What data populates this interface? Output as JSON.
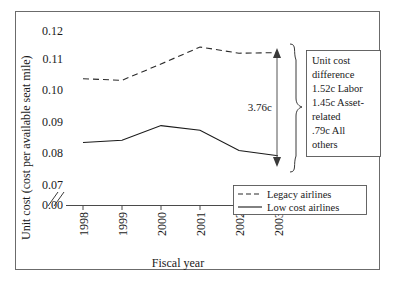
{
  "chart_data": {
    "type": "line",
    "title": "",
    "xlabel": "Fiscal year",
    "ylabel": "Unit cost (cost per available seat mile)",
    "categories": [
      "1998",
      "1999",
      "2000",
      "2001",
      "2002",
      "2003"
    ],
    "xtick_labels": [
      "1998",
      "1999",
      "2000",
      "2001",
      "2002",
      "2003"
    ],
    "ytick_labels": [
      "0.12",
      "0.11",
      "0.10",
      "0.09",
      "0.08",
      "0.07",
      "0.00"
    ],
    "ylim": [
      0.07,
      0.125
    ],
    "y_axis_break": true,
    "y_axis_break_label": "0.00",
    "grid": false,
    "legend_position": "bottom-right",
    "series": [
      {
        "name": "Legacy airlines",
        "style": "dashed",
        "values": [
          0.1045,
          0.104,
          0.1093,
          0.1148,
          0.1128,
          0.113
        ]
      },
      {
        "name": "Low cost airlines",
        "style": "solid",
        "values": [
          0.0838,
          0.0845,
          0.0893,
          0.0878,
          0.0812,
          0.0795
        ]
      }
    ],
    "annotations": [
      {
        "name": "difference-arrow",
        "label": "3.76c",
        "from_series": "Legacy airlines",
        "to_series": "Low cost airlines",
        "at_category": "2003"
      }
    ]
  },
  "axis": {
    "y_title": "Unit cost (cost per available seat mile)",
    "x_title": "Fiscal year",
    "y_ticks": [
      "0.12",
      "0.11",
      "0.10",
      "0.09",
      "0.08",
      "0.07",
      "0.00"
    ],
    "x_ticks": [
      "1998",
      "1999",
      "2000",
      "2001",
      "2002",
      "2003"
    ]
  },
  "legend": {
    "entries": [
      {
        "label": "Legacy airlines",
        "style": "dashed"
      },
      {
        "label": "Low cost airlines",
        "style": "solid"
      }
    ]
  },
  "arrow_label": "3.76c",
  "callout": {
    "lines": [
      "Unit cost",
      "difference",
      "1.52c Labor",
      "1.45c Asset-",
      "related",
      ".79c All",
      "others"
    ]
  },
  "colors": {
    "line": "#1a1a1a",
    "axis": "#4a4a4a",
    "frame": "#6b6b6b",
    "background": "#ffffff"
  }
}
